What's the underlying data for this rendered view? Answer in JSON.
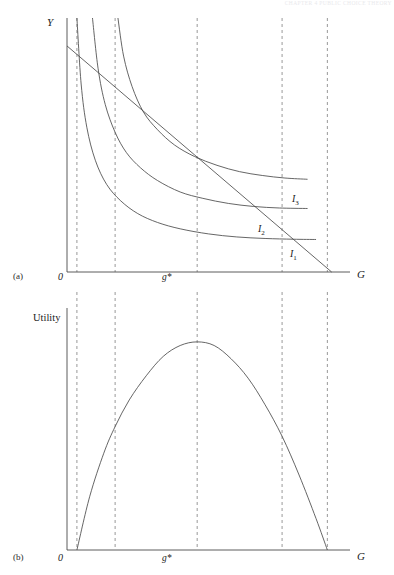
{
  "figure": {
    "header_text": "CHAPTER 4  PUBLIC CHOICE THEORY",
    "panels": [
      {
        "tag": "(a)",
        "y_axis_label": "Y",
        "x_axis_label": "G",
        "origin_label": "0",
        "gstar_label": "g*",
        "curve_labels": [
          {
            "text": "I",
            "sub": "3"
          },
          {
            "text": "I",
            "sub": "2"
          },
          {
            "text": "I",
            "sub": "1"
          }
        ]
      },
      {
        "tag": "(b)",
        "y_axis_label": "Utility",
        "x_axis_label": "G",
        "origin_label": "0",
        "gstar_label": "g*"
      }
    ]
  },
  "chart_data": {
    "type": "line",
    "title": "",
    "subtitle": "",
    "panels": [
      {
        "id": "a",
        "xlabel": "G",
        "ylabel": "Y",
        "xlim": [
          0,
          100
        ],
        "ylim": [
          0,
          100
        ],
        "grid": false,
        "legend": "inline-right",
        "series": [
          {
            "name": "I1",
            "kind": "indifference-curve",
            "label": "I1",
            "label_at": [
              81,
              18
            ],
            "points": [
              [
                3.5,
                100
              ],
              [
                5,
                74
              ],
              [
                7,
                57
              ],
              [
                10,
                44
              ],
              [
                14,
                34.5
              ],
              [
                19,
                28
              ],
              [
                25,
                23
              ],
              [
                32,
                19.5
              ],
              [
                40,
                17
              ],
              [
                50,
                15
              ],
              [
                60,
                13.8
              ],
              [
                70,
                13.2
              ],
              [
                80,
                12.9
              ],
              [
                88,
                12.8
              ]
            ]
          },
          {
            "name": "I2",
            "kind": "indifference-curve",
            "label": "I2",
            "label_at": [
              81,
              33
            ],
            "points": [
              [
                9,
                100
              ],
              [
                11,
                80
              ],
              [
                13.5,
                66
              ],
              [
                17,
                55
              ],
              [
                21,
                47
              ],
              [
                26,
                41
              ],
              [
                32,
                36
              ],
              [
                40,
                31.5
              ],
              [
                48,
                29
              ],
              [
                57,
                27
              ],
              [
                66,
                25.8
              ],
              [
                75,
                25.2
              ],
              [
                85,
                25
              ]
            ]
          },
          {
            "name": "I3",
            "kind": "indifference-curve",
            "label": "I3",
            "label_at": [
              81,
              47
            ],
            "points": [
              [
                18,
                100
              ],
              [
                20,
                85
              ],
              [
                23,
                73
              ],
              [
                27,
                63
              ],
              [
                32,
                56
              ],
              [
                38,
                50
              ],
              [
                45,
                45.5
              ],
              [
                53,
                42
              ],
              [
                61,
                39.5
              ],
              [
                69,
                38
              ],
              [
                77,
                37
              ],
              [
                85,
                36.5
              ]
            ]
          },
          {
            "name": "budget-line",
            "kind": "line",
            "points": [
              [
                0,
                89
              ],
              [
                93.5,
                0
              ]
            ]
          }
        ],
        "tangency": {
          "label": "g*",
          "x": 41,
          "y": 31.5
        },
        "dashed_x": [
          3.5,
          17,
          46,
          76,
          92
        ]
      },
      {
        "id": "b",
        "xlabel": "G",
        "ylabel": "Utility",
        "xlim": [
          0,
          100
        ],
        "ylim": [
          0,
          100
        ],
        "grid": false,
        "series": [
          {
            "name": "utility",
            "kind": "curve",
            "points": [
              [
                3.5,
                0
              ],
              [
                8,
                22
              ],
              [
                13,
                40
              ],
              [
                17,
                51
              ],
              [
                22,
                62
              ],
              [
                28,
                72
              ],
              [
                34,
                80
              ],
              [
                40,
                84.5
              ],
              [
                46,
                86
              ],
              [
                52,
                84.5
              ],
              [
                58,
                79
              ],
              [
                64,
                71
              ],
              [
                70,
                60
              ],
              [
                76,
                47
              ],
              [
                82,
                31
              ],
              [
                88,
                13
              ],
              [
                92,
                0
              ]
            ]
          }
        ],
        "peak": {
          "label": "g*",
          "x": 46,
          "y": 86
        },
        "dashed_x": [
          3.5,
          17,
          46,
          76,
          92
        ]
      }
    ]
  }
}
